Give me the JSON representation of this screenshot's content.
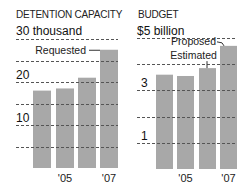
{
  "chart_data": [
    {
      "type": "bar",
      "title": "DETENTION CAPACITY",
      "unit_label": "30 thousand",
      "categories": [
        "'04",
        "'05",
        "'06",
        "'07"
      ],
      "x_tick_labels": [
        "",
        "'05",
        "",
        "'07"
      ],
      "values": [
        18,
        18.5,
        21,
        27.5
      ],
      "ylim": [
        0,
        30
      ],
      "y_gridlines": [
        5,
        10,
        15,
        20,
        25,
        30
      ],
      "y_tick_labels": [
        {
          "value": 10,
          "label": "10"
        },
        {
          "value": 20,
          "label": "20"
        }
      ],
      "annotations": [
        {
          "category_index": 3,
          "text": "Requested"
        }
      ],
      "grid": true,
      "bar_color": "#a8a8a8"
    },
    {
      "type": "bar",
      "title": "BUDGET",
      "unit_label": "$5 billion",
      "categories": [
        "'04",
        "'05",
        "'06",
        "'07"
      ],
      "x_tick_labels": [
        "",
        "'05",
        "",
        "'07"
      ],
      "values": [
        3.6,
        3.55,
        3.85,
        4.7
      ],
      "ylim": [
        0,
        5
      ],
      "y_gridlines": [
        1,
        2,
        3,
        4,
        5
      ],
      "y_tick_labels": [
        {
          "value": 1,
          "label": "1"
        },
        {
          "value": 3,
          "label": "3"
        }
      ],
      "annotations": [
        {
          "category_index": 2,
          "text": "Estimated"
        },
        {
          "category_index": 3,
          "text": "Proposed"
        }
      ],
      "grid": true,
      "bar_color": "#a8a8a8"
    }
  ]
}
